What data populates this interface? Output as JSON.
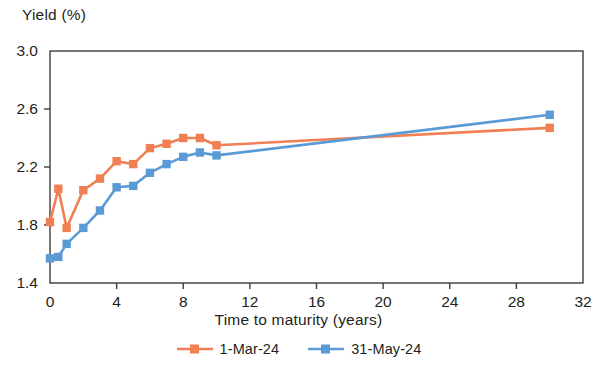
{
  "chart_data": {
    "type": "line",
    "title": "",
    "xlabel": "Time to maturity (years)",
    "ylabel": "Yield (%)",
    "xlim": [
      0,
      32
    ],
    "ylim": [
      1.4,
      3.0
    ],
    "xticks": [
      "0",
      "4",
      "8",
      "12",
      "16",
      "20",
      "24",
      "28",
      "32"
    ],
    "xtick_values": [
      0,
      4,
      8,
      12,
      16,
      20,
      24,
      28,
      32
    ],
    "yticks": [
      "3.0",
      "2.6",
      "2.2",
      "1.8",
      "1.4"
    ],
    "ytick_values": [
      3.0,
      2.6,
      2.2,
      1.8,
      1.4
    ],
    "grid": false,
    "legend_position": "bottom",
    "markers": "square",
    "series": [
      {
        "name": "1-Mar-24",
        "color": "#f07f54",
        "x": [
          0,
          0.5,
          1,
          2,
          3,
          4,
          5,
          6,
          7,
          8,
          9,
          10,
          30
        ],
        "values": [
          1.82,
          2.05,
          1.78,
          2.04,
          2.12,
          2.24,
          2.22,
          2.33,
          2.36,
          2.4,
          2.4,
          2.35,
          2.47
        ]
      },
      {
        "name": "31-May-24",
        "color": "#5b9bd5",
        "x": [
          0,
          0.5,
          1,
          2,
          3,
          4,
          5,
          6,
          7,
          8,
          9,
          10,
          30
        ],
        "values": [
          1.57,
          1.58,
          1.67,
          1.78,
          1.9,
          2.06,
          2.07,
          2.16,
          2.22,
          2.27,
          2.3,
          2.28,
          2.56
        ]
      }
    ]
  },
  "legend": {
    "items": [
      {
        "label": "1-Mar-24"
      },
      {
        "label": "31-May-24"
      }
    ]
  },
  "axes": {
    "y_title": "Yield (%)",
    "x_title": "Time to maturity (years)"
  },
  "colors": {
    "series_1": "#f07f54",
    "series_2": "#5b9bd5",
    "frame": "#3d3d3d",
    "text": "#231f20"
  }
}
